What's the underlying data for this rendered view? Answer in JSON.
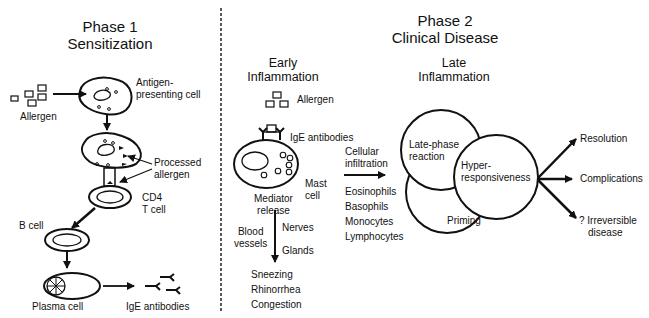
{
  "phase1": {
    "title_line1": "Phase 1",
    "title_line2": "Sensitization",
    "labels": {
      "allergen": "Allergen",
      "apc_line1": "Antigen-",
      "apc_line2": "presenting cell",
      "processed_line1": "Processed",
      "processed_line2": "allergen",
      "cd4_line1": "CD4",
      "cd4_line2": "T cell",
      "b_cell": "B cell",
      "plasma_cell": "Plasma cell",
      "ige_antibodies": "IgE antibodies"
    }
  },
  "phase2": {
    "title_line1": "Phase 2",
    "title_line2": "Clinical Disease",
    "early": {
      "title_line1": "Early",
      "title_line2": "Inflammation",
      "allergen": "Allergen",
      "ige_antibodies": "IgE antibodies",
      "mast_line1": "Mast",
      "mast_line2": "cell",
      "mediator_line1": "Mediator",
      "mediator_line2": "release",
      "blood_line1": "Blood",
      "blood_line2": "vessels",
      "nerves": "Nerves",
      "glands": "Glands",
      "symptoms": [
        "Sneezing",
        "Rhinorrhea",
        "Congestion"
      ],
      "cellular_line1": "Cellular",
      "cellular_line2": "infiltration",
      "cells": [
        "Eosinophils",
        "Basophils",
        "Monocytes",
        "Lymphocytes"
      ]
    },
    "late": {
      "title_line1": "Late",
      "title_line2": "Inflammation",
      "circles": {
        "late_phase_line1": "Late-phase",
        "late_phase_line2": "reaction",
        "hyper_line1": "Hyper-",
        "hyper_line2": "responsiveness",
        "priming": "Priming"
      },
      "outcomes": {
        "resolution": "Resolution",
        "complications": "Complications",
        "irreversible_line1": "? Irreversible",
        "irreversible_line2": "disease"
      }
    }
  }
}
